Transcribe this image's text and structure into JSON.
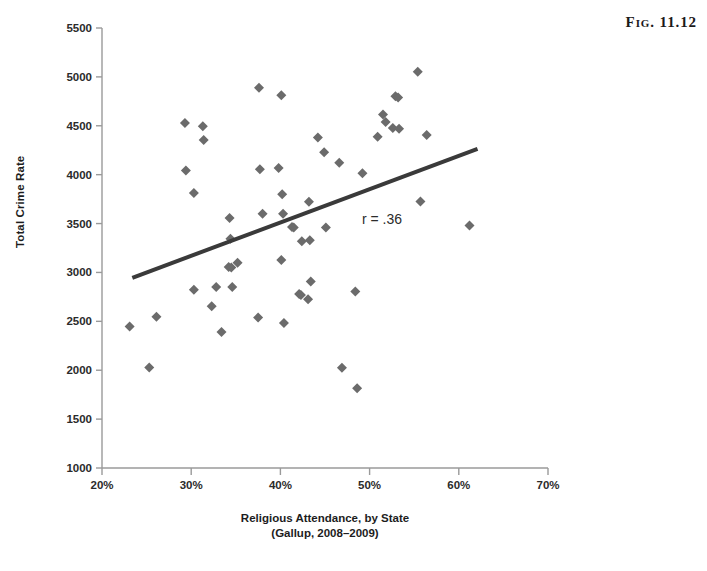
{
  "figure": {
    "caption": "Fig. 11.12"
  },
  "annotation": {
    "correlation_label": "r = .36"
  },
  "chart_data": {
    "type": "scatter",
    "title": "",
    "subtitle": "",
    "xlabel": "Religious Attendance, by State",
    "xlabel_line2": "(Gallup, 2008–2009)",
    "ylabel": "Total Crime Rate",
    "xlim": [
      20,
      70
    ],
    "ylim": [
      1000,
      5500
    ],
    "xticks": [
      20,
      30,
      40,
      50,
      60,
      70
    ],
    "xtick_labels": [
      "20%",
      "30%",
      "40%",
      "50%",
      "60%",
      "70%"
    ],
    "yticks": [
      1000,
      1500,
      2000,
      2500,
      3000,
      3500,
      4000,
      4500,
      5000,
      5500
    ],
    "ytick_labels": [
      "1000",
      "1500",
      "2000",
      "2500",
      "3000",
      "3500",
      "4000",
      "4500",
      "5000",
      "5500"
    ],
    "grid": false,
    "legend": false,
    "legend_position": "none",
    "marker": "diamond",
    "marker_color": "#6b6b6b",
    "marker_size": 7,
    "correlation": 0.36,
    "trendline": {
      "type": "linear",
      "color": "#3a3a3a",
      "width": 4,
      "x_start": 23.4,
      "y_start": 2945,
      "x_end": 62.1,
      "y_end": 4265
    },
    "x": [
      23.1,
      25.3,
      26.1,
      29.3,
      29.4,
      30.3,
      31.3,
      31.4,
      30.3,
      32.3,
      32.8,
      33.4,
      34.2,
      34.3,
      34.4,
      34.5,
      35.2,
      34.6,
      37.6,
      37.7,
      37.5,
      38.0,
      39.8,
      40.1,
      40.2,
      40.3,
      40.1,
      40.4,
      41.3,
      41.5,
      42.1,
      42.3,
      42.4,
      43.1,
      43.2,
      43.4,
      43.3,
      44.2,
      44.9,
      45.1,
      46.6,
      46.9,
      48.4,
      48.6,
      49.2,
      50.9,
      51.5,
      51.8,
      52.6,
      52.9,
      53.2,
      53.3,
      55.4,
      55.7,
      56.4,
      61.2
    ],
    "y": [
      2447,
      2027,
      2546,
      4528,
      4043,
      2824,
      4495,
      4355,
      3812,
      2655,
      2852,
      2390,
      3055,
      3556,
      3345,
      3051,
      3100,
      2850,
      4888,
      4055,
      2538,
      3600,
      4068,
      4811,
      3799,
      3601,
      3127,
      2484,
      3466,
      3460,
      2780,
      2770,
      3320,
      2725,
      3722,
      2908,
      3330,
      4381,
      4228,
      3460,
      4122,
      2025,
      2805,
      1815,
      4015,
      4388,
      4615,
      4538,
      4478,
      4802,
      4790,
      4470,
      5053,
      3725,
      4405,
      3481
    ],
    "point_count": 56
  }
}
